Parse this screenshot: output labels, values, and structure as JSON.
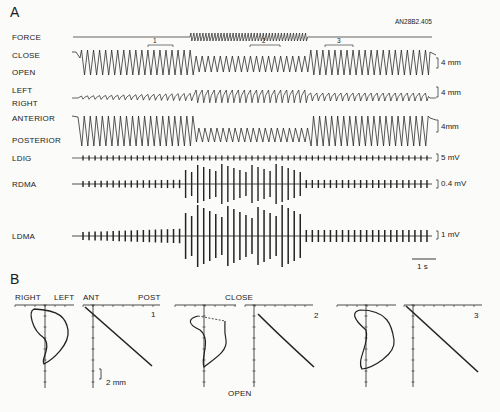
{
  "figure_id": "AN28B2.405",
  "panelA": {
    "label": "A",
    "channels": [
      {
        "name": "FORCE",
        "y": 37
      },
      {
        "name": "CLOSE",
        "y": 56
      },
      {
        "name": "OPEN",
        "y": 74
      },
      {
        "name": "LEFT",
        "y": 94
      },
      {
        "name": "RIGHT",
        "y": 108
      },
      {
        "name": "ANTERIOR",
        "y": 123
      },
      {
        "name": "POSTERIOR",
        "y": 144
      },
      {
        "name": "LDIG",
        "y": 158
      },
      {
        "name": "RDMA",
        "y": 184
      },
      {
        "name": "LDMA",
        "y": 236
      }
    ],
    "scale_bars": [
      {
        "label": "4 mm",
        "y": 63
      },
      {
        "label": "4 mm",
        "y": 92
      },
      {
        "label": "4mm",
        "y": 126
      },
      {
        "label": "5 mV",
        "y": 157
      },
      {
        "label": "0.4 mV",
        "y": 183
      },
      {
        "label": "1 mV",
        "y": 234
      }
    ],
    "segments": [
      {
        "label": "1",
        "x1": 148,
        "x2": 173
      },
      {
        "label": "2",
        "x1": 250,
        "x2": 280
      },
      {
        "label": "3",
        "x1": 325,
        "x2": 353
      }
    ],
    "time_scale": "1 s"
  },
  "panelB": {
    "label": "B",
    "axis_labels": {
      "right": "RIGHT",
      "left": "LEFT",
      "ant": "ANT",
      "post": "POST",
      "close": "CLOSE",
      "open": "OPEN"
    },
    "plot_numbers": [
      "1",
      "2",
      "3"
    ],
    "scale": "2 mm"
  }
}
